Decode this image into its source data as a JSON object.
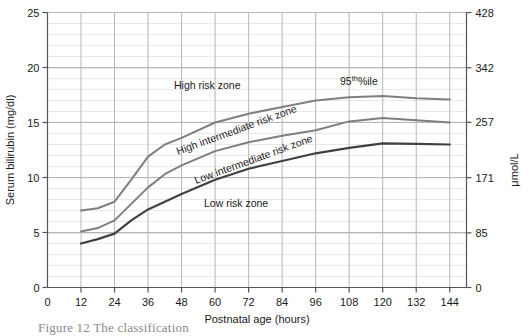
{
  "figure": {
    "caption": "Figure 12 The classification"
  },
  "axes": {
    "y_left": {
      "title": "Serum bilirubin (mg/dl)",
      "ticks": [
        0,
        5,
        10,
        15,
        20,
        25
      ],
      "min": 0,
      "max": 25
    },
    "y_right": {
      "title": "μmol/L",
      "ticks": [
        0,
        85,
        171,
        257,
        342,
        428
      ],
      "min": 0,
      "max": 428
    },
    "x": {
      "title": "Postnatal age (hours)",
      "ticks": [
        0,
        12,
        24,
        36,
        48,
        60,
        72,
        84,
        96,
        108,
        120,
        132,
        144
      ],
      "min": 0,
      "max": 150
    }
  },
  "annotations": [
    {
      "id": "high-risk-zone",
      "text": "High risk zone",
      "x": 174,
      "y": 89,
      "rotate": 0
    },
    {
      "id": "high-intermediate-risk-zone",
      "text": "High intermediate risk zone",
      "x": 178,
      "y": 155,
      "rotate": -20
    },
    {
      "id": "low-intermediate-risk-zone",
      "text": "Low intermediate risk zone",
      "x": 196,
      "y": 184,
      "rotate": -20
    },
    {
      "id": "low-risk-zone",
      "text": "Low risk zone",
      "x": 204,
      "y": 207,
      "rotate": 0
    }
  ],
  "percentile_label": {
    "base": "95",
    "superscript": "th",
    "suffix": "%ile",
    "x": 340,
    "y": 85
  },
  "colors": {
    "grid_minor": "#e9e9e9",
    "grid_major": "#b6b6b6",
    "axis": "#555555",
    "curve_high": "#7f7f7f",
    "curve_high_intermediate": "#7f7f7f",
    "curve_low_intermediate": "#404040",
    "text": "#1a1a1a",
    "background": "#ffffff"
  },
  "chart_data": {
    "type": "line",
    "title": "",
    "subtitle": "",
    "xlabel": "Postnatal age (hours)",
    "ylabel": "Serum bilirubin (mg/dl)",
    "y2label": "μmol/L",
    "xlim": [
      0,
      150
    ],
    "ylim": [
      0,
      25
    ],
    "y2lim": [
      0,
      428
    ],
    "grid": true,
    "legend_position": "none",
    "x": [
      12,
      18,
      24,
      30,
      36,
      42,
      48,
      60,
      72,
      84,
      96,
      108,
      120,
      132,
      144
    ],
    "series": [
      {
        "name": "95th %ile (high risk zone upper bound)",
        "values": [
          7.0,
          7.2,
          7.8,
          9.8,
          11.9,
          13.0,
          13.6,
          15.0,
          15.8,
          16.4,
          17.0,
          17.3,
          17.4,
          17.2,
          17.1
        ]
      },
      {
        "name": "75th %ile (high intermediate / low intermediate boundary)",
        "values": [
          5.1,
          5.4,
          6.1,
          7.6,
          9.1,
          10.3,
          11.1,
          12.4,
          13.2,
          13.8,
          14.3,
          15.1,
          15.4,
          15.2,
          15.0
        ]
      },
      {
        "name": "40th %ile (low risk zone upper bound)",
        "values": [
          4.0,
          4.4,
          4.9,
          6.1,
          7.1,
          7.8,
          8.5,
          9.8,
          10.8,
          11.5,
          12.2,
          12.7,
          13.1,
          13.05,
          13.0
        ]
      }
    ]
  }
}
